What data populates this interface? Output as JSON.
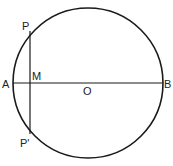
{
  "diagram": {
    "labels": {
      "P": "P",
      "M": "M",
      "A": "A",
      "O": "O",
      "B": "B",
      "P_prime": "P'"
    },
    "stroke_color": "#1a1a1a",
    "background": "#ffffff"
  }
}
